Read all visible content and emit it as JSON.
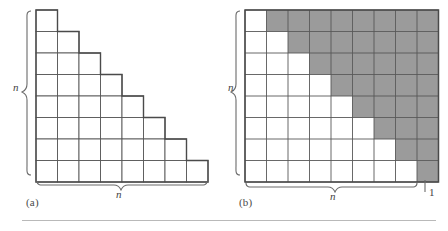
{
  "figure": {
    "kind": "staircase-vs-rectangle-grid-comparison",
    "panels": [
      {
        "id": "a",
        "caption": "(a)",
        "type": "staircase-grid",
        "rows": 8,
        "max_columns": 8,
        "row_cell_counts": [
          1,
          2,
          3,
          4,
          5,
          6,
          7,
          8
        ],
        "shaded_cells": 0,
        "labels": {
          "vertical": "n",
          "horizontal": "n"
        }
      },
      {
        "id": "b",
        "caption": "(b)",
        "type": "rectangular-grid",
        "rows": 8,
        "columns": 9,
        "white_cells_per_row": [
          1,
          2,
          3,
          4,
          5,
          6,
          7,
          8
        ],
        "shaded_cells_per_row": [
          8,
          7,
          6,
          5,
          4,
          3,
          2,
          1
        ],
        "labels": {
          "vertical": "n",
          "horizontal": "n",
          "extra_column": "1"
        }
      }
    ],
    "colors": {
      "cell_fill": "#ffffff",
      "shaded_fill": "#9b9b9b",
      "grid_line": "#585858",
      "outline": "#4a4a4a",
      "brace": "#6b6b6b",
      "rule": "#b9b9b9",
      "text": "#3a3a3a"
    },
    "geometry": {
      "cell_size": 21.5,
      "panel_a_origin": [
        36,
        10
      ],
      "panel_b_origin": [
        245,
        10
      ]
    }
  },
  "captions": {
    "a": "(a)",
    "b": "(b)"
  },
  "dimension_labels": {
    "n_left_vertical": "n",
    "n_left_horizontal": "n",
    "n_right_vertical": "n",
    "n_right_horizontal": "n",
    "one_right": "1"
  }
}
